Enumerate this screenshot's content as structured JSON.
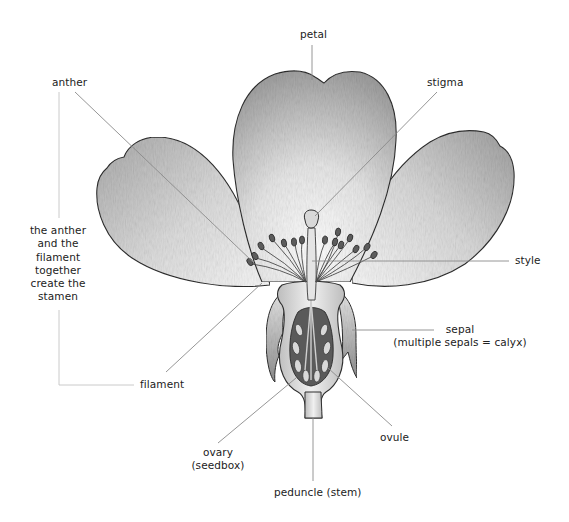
{
  "diagram": {
    "labels": {
      "petal": "petal",
      "stigma": "stigma",
      "anther": "anther",
      "style": "style",
      "stamen_note": [
        "the anther",
        "and the",
        "filament",
        "together",
        "create the",
        "stamen"
      ],
      "sepal": "sepal",
      "sepal_note": "(multiple sepals = calyx)",
      "filament": "filament",
      "ovary": "ovary",
      "ovary_note": "(seedbox)",
      "ovule": "ovule",
      "peduncle": "peduncle (stem)"
    },
    "colors": {
      "background": "#ffffff",
      "text": "#222222",
      "leader_line": "#8a8a8a",
      "bracket_line": "#c4c4c4",
      "outline": "#2e2e2e"
    }
  }
}
